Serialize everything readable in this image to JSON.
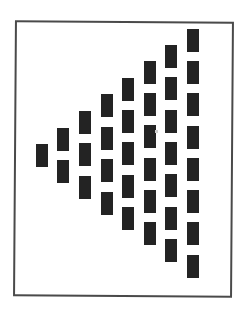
{
  "figure": {
    "frame": {
      "left": 14,
      "top": 21,
      "width": 219,
      "height": 276,
      "border_color": "#4a4a4a"
    },
    "block_size": {
      "width": 12,
      "height": 23
    },
    "block_color": "#232323",
    "columns": [
      {
        "index": 1,
        "x": 36,
        "ys": [
          144
        ]
      },
      {
        "index": 2,
        "x": 57,
        "ys": [
          128,
          160
        ]
      },
      {
        "index": 3,
        "x": 79,
        "ys": [
          111,
          143,
          176
        ]
      },
      {
        "index": 4,
        "x": 101,
        "ys": [
          94,
          127,
          159,
          192
        ]
      },
      {
        "index": 5,
        "x": 122,
        "ys": [
          78,
          110,
          142,
          175,
          207
        ]
      },
      {
        "index": 6,
        "x": 144,
        "ys": [
          61,
          93,
          125,
          158,
          190,
          222
        ]
      },
      {
        "index": 7,
        "x": 165,
        "ys": [
          45,
          77,
          110,
          142,
          174,
          207,
          239
        ]
      },
      {
        "index": 8,
        "x": 187,
        "ys": [
          29,
          61,
          93,
          126,
          158,
          190,
          222,
          255
        ]
      }
    ],
    "total_blocks": 36
  }
}
